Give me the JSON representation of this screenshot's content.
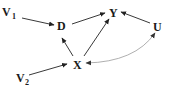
{
  "diagram": {
    "type": "causal-dag",
    "nodes": [
      {
        "id": "V1",
        "label": "V",
        "subscript": "1",
        "x": 9,
        "y": 16
      },
      {
        "id": "D",
        "label": "D",
        "subscript": "",
        "x": 62,
        "y": 29
      },
      {
        "id": "Y",
        "label": "Y",
        "subscript": "",
        "x": 114,
        "y": 16
      },
      {
        "id": "U",
        "label": "U",
        "subscript": "",
        "x": 158,
        "y": 30
      },
      {
        "id": "X",
        "label": "X",
        "subscript": "",
        "x": 78,
        "y": 68
      },
      {
        "id": "V2",
        "label": "V",
        "subscript": "2",
        "x": 20,
        "y": 81
      }
    ],
    "edges": [
      {
        "from": "V1",
        "to": "D",
        "style": "directed"
      },
      {
        "from": "D",
        "to": "Y",
        "style": "directed"
      },
      {
        "from": "U",
        "to": "Y",
        "style": "directed"
      },
      {
        "from": "X",
        "to": "D",
        "style": "directed"
      },
      {
        "from": "X",
        "to": "Y",
        "style": "directed"
      },
      {
        "from": "V2",
        "to": "X",
        "style": "directed"
      },
      {
        "from": "X",
        "to": "U",
        "style": "bidirected-curved"
      }
    ],
    "colors": {
      "node_text": "#1a1a1a",
      "edge": "#222222",
      "bidirected_edge": "#9a9a9a",
      "background": "#ffffff"
    }
  }
}
